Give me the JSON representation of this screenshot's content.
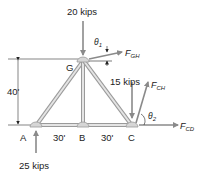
{
  "diagram": {
    "type": "truss free-body diagram",
    "nodes": {
      "A": {
        "label": "A"
      },
      "B": {
        "label": "B"
      },
      "C": {
        "label": "C"
      },
      "G": {
        "label": "G"
      }
    },
    "dimensions": {
      "height": "40'",
      "span_ab": "30'",
      "span_bc": "30'"
    },
    "loads": {
      "top_load": "20 kips",
      "c_load": "15 kips",
      "reaction_a": "25 kips"
    },
    "forces": {
      "fgh_main": "F",
      "fgh_sub": "GH",
      "fch_main": "F",
      "fch_sub": "CH",
      "fcd_main": "F",
      "fcd_sub": "CD"
    },
    "angles": {
      "theta1_main": "θ",
      "theta1_sub": "1",
      "theta2_main": "θ",
      "theta2_sub": "2"
    },
    "colors": {
      "member": "#9a9a9a",
      "member_fill": "#d6d6d6",
      "arrow": "#8a8a8a",
      "text": "#222222"
    }
  }
}
